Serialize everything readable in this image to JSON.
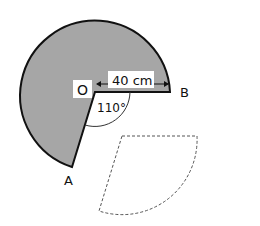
{
  "figure": {
    "labels": {
      "center": "O",
      "pointA": "A",
      "pointB": "B"
    },
    "radius_label": "40 cm",
    "angle_label": "110°",
    "colors": {
      "sector_fill": "#a6a6a6",
      "stroke": "#111111",
      "dashed": "#555555"
    }
  }
}
